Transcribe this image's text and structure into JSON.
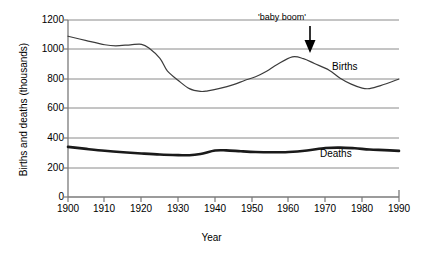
{
  "chart_data": {
    "type": "line",
    "title": "",
    "xlabel": "Year",
    "ylabel": "Births and deaths (thousands)",
    "xlim": [
      1900,
      1990
    ],
    "ylim": [
      0,
      1200
    ],
    "grid": true,
    "legend_position": "inline-labels",
    "xticks": [
      "1900",
      "1910",
      "1920",
      "1930",
      "1940",
      "1950",
      "1960",
      "1970",
      "1980",
      "1990"
    ],
    "yticks": [
      "0",
      "200",
      "400",
      "600",
      "800",
      "1000",
      "1200"
    ],
    "annotations": [
      {
        "text": "'baby boom'",
        "x": 1961,
        "y": 950,
        "marker": "down-arrow"
      }
    ],
    "series": [
      {
        "name": "Births",
        "label": "Births",
        "color": "#3c3c3c",
        "width": 1.2,
        "x": [
          1900,
          1905,
          1910,
          1913,
          1917,
          1920,
          1922,
          1925,
          1927,
          1930,
          1933,
          1936,
          1938,
          1941,
          1945,
          1948,
          1951,
          1954,
          1957,
          1961,
          1964,
          1967,
          1971,
          1974,
          1977,
          1980,
          1982,
          1985,
          1990
        ],
        "values": [
          1090,
          1060,
          1032,
          1025,
          1032,
          1035,
          1010,
          940,
          855,
          790,
          735,
          716,
          720,
          735,
          762,
          790,
          815,
          852,
          900,
          950,
          938,
          905,
          860,
          805,
          765,
          738,
          735,
          755,
          800
        ]
      },
      {
        "name": "Deaths",
        "label": "Deaths",
        "color": "#1a1a1a",
        "width": 2.6,
        "x": [
          1900,
          1905,
          1910,
          1915,
          1920,
          1925,
          1930,
          1933,
          1936,
          1940,
          1943,
          1947,
          1951,
          1955,
          1960,
          1965,
          1970,
          1974,
          1978,
          1982,
          1986,
          1990
        ],
        "values": [
          340,
          326,
          313,
          303,
          295,
          288,
          284,
          283,
          292,
          315,
          316,
          310,
          305,
          303,
          305,
          315,
          332,
          335,
          330,
          322,
          318,
          313
        ]
      }
    ]
  },
  "labels": {
    "births": "Births",
    "deaths": "Deaths",
    "baby_boom": "'baby boom'",
    "xtitle": "Year",
    "ytitle": "Births and deaths (thousands)"
  }
}
